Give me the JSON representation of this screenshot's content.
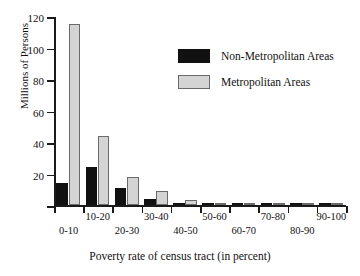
{
  "chart_data": {
    "type": "bar",
    "title": "",
    "xlabel": "Poverty rate of census tract (in percent)",
    "ylabel": "Millions of Persons",
    "categories": [
      "0-10",
      "10-20",
      "20-30",
      "30-40",
      "40-50",
      "50-60",
      "60-70",
      "70-80",
      "80-90",
      "90-100"
    ],
    "series": [
      {
        "name": "Non-Metropolitan Areas",
        "color": "#111111",
        "values": [
          14,
          24,
          11,
          4,
          1.5,
          0.5,
          0.3,
          0.2,
          0.1,
          0.1
        ]
      },
      {
        "name": "Metropolitan Areas",
        "color": "#d4d4d4",
        "values": [
          115,
          44,
          18,
          9,
          3,
          1.2,
          0.5,
          0.3,
          0.2,
          0.1
        ]
      }
    ],
    "ylim": [
      0,
      120
    ],
    "yticks": [
      0,
      20,
      40,
      60,
      80,
      100,
      120
    ],
    "ytick_labels": [
      "",
      "20",
      "40",
      "60",
      "80",
      "100",
      "120"
    ],
    "grid": false,
    "legend_position": "upper-right"
  },
  "legend": {
    "entries": [
      {
        "label": "Non-Metropolitan Areas"
      },
      {
        "label": "Metropolitan Areas"
      }
    ]
  },
  "axes": {
    "y_title": "Millions of Persons",
    "x_title": "Poverty rate of census tract (in percent)"
  }
}
